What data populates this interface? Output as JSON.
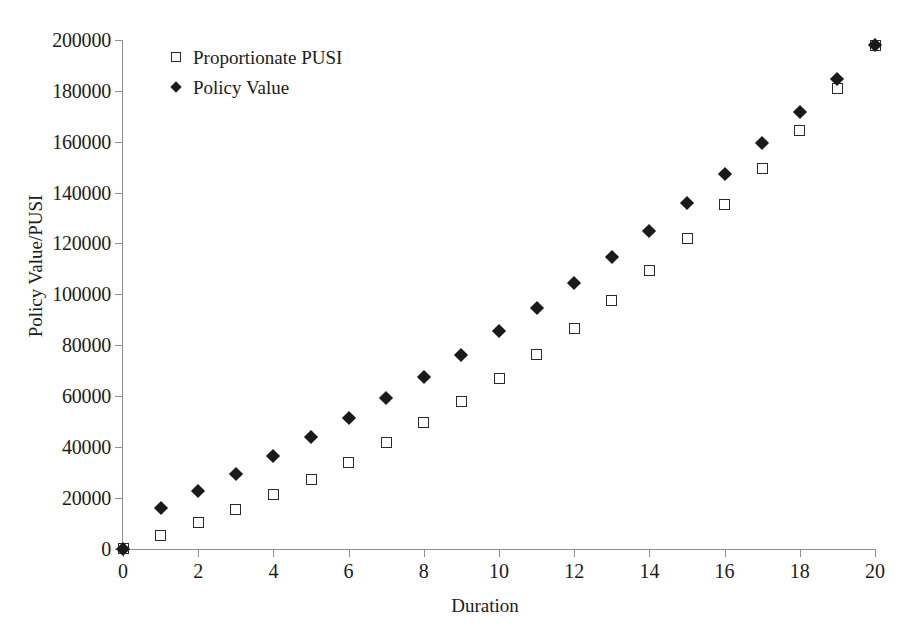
{
  "chart_data": {
    "type": "scatter",
    "title": "",
    "xlabel": "Duration",
    "ylabel": "Policy Value/PUSI",
    "xlim": [
      0,
      20
    ],
    "ylim": [
      0,
      200000
    ],
    "xticks": [
      0,
      2,
      4,
      6,
      8,
      10,
      12,
      14,
      16,
      18,
      20
    ],
    "xtick_labels": [
      "0",
      "2",
      "4",
      "6",
      "8",
      "10",
      "12",
      "14",
      "16",
      "18",
      "20"
    ],
    "yticks": [
      0,
      20000,
      40000,
      60000,
      80000,
      100000,
      120000,
      140000,
      160000,
      180000,
      200000
    ],
    "ytick_labels": [
      "0",
      "20000",
      "40000",
      "60000",
      "80000",
      "100000",
      "120000",
      "140000",
      "160000",
      "180000",
      "200000"
    ],
    "grid": false,
    "legend_position": "top-left",
    "x": [
      0,
      1,
      2,
      3,
      4,
      5,
      6,
      7,
      8,
      9,
      10,
      11,
      12,
      13,
      14,
      15,
      16,
      17,
      18,
      19,
      20
    ],
    "series": [
      {
        "name": "Proportionate PUSI",
        "marker": "open-square",
        "color": "#2b2b2b",
        "values": [
          0,
          5200,
          10100,
          15300,
          21100,
          27300,
          34000,
          41500,
          49400,
          57800,
          66700,
          76300,
          86600,
          97500,
          109300,
          122000,
          135200,
          149400,
          164500,
          181000,
          198000
        ]
      },
      {
        "name": "Policy Value",
        "marker": "filled-diamond",
        "color": "#1a1a1a",
        "values": [
          0,
          16000,
          22500,
          29300,
          36400,
          43700,
          51300,
          59300,
          67600,
          76300,
          85400,
          94400,
          104300,
          114500,
          125000,
          136000,
          147300,
          159400,
          171600,
          184800,
          198000
        ]
      }
    ]
  },
  "legend": {
    "items": [
      {
        "label": "Proportionate PUSI",
        "marker": "open-square"
      },
      {
        "label": "Policy Value",
        "marker": "filled-diamond"
      }
    ]
  },
  "axes": {
    "x_title": "Duration",
    "y_title": "Policy Value/PUSI"
  }
}
